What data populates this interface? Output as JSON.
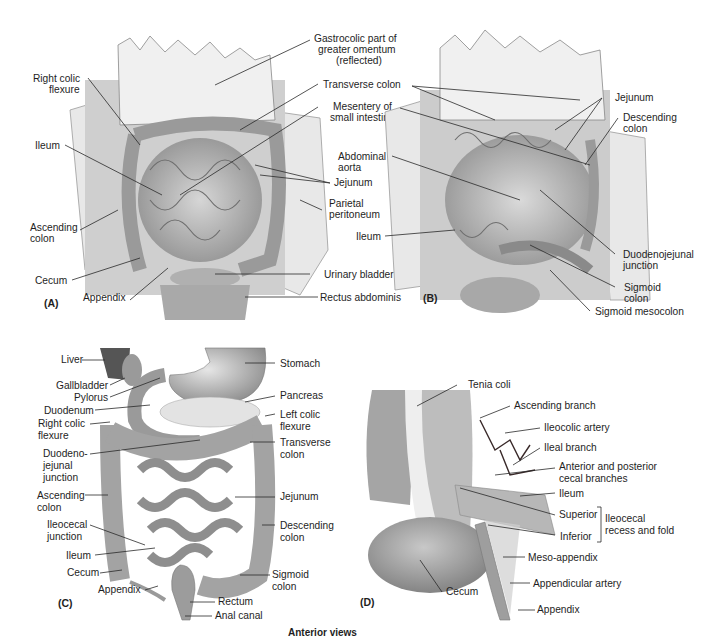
{
  "figure": {
    "caption": "Anterior views",
    "panels": {
      "A": {
        "tag": "(A)",
        "labels": {
          "gastrocolic": [
            "Gastrocolic part of",
            "greater omentum",
            "(reflected)"
          ],
          "right_colic_flexure": [
            "Right colic",
            "flexure"
          ],
          "transverse_colon": "Transverse colon",
          "mesentery": [
            "Mesentery of",
            "small intestine"
          ],
          "ileum": "Ileum",
          "jejunum": "Jejunum",
          "parietal_peritoneum": [
            "Parietal",
            "peritoneum"
          ],
          "ascending_colon": [
            "Ascending",
            "colon"
          ],
          "cecum": "Cecum",
          "urinary_bladder": "Urinary bladder",
          "appendix": "Appendix",
          "rectus_abdominis": "Rectus abdominis"
        }
      },
      "B": {
        "tag": "(B)",
        "labels": {
          "jejunum": "Jejunum",
          "descending_colon": [
            "Descending",
            "colon"
          ],
          "abdominal_aorta": [
            "Abdominal",
            "aorta"
          ],
          "ileum": "Ileum",
          "duodenojejunal_junction": [
            "Duodenojejunal",
            "junction"
          ],
          "sigmoid_colon": [
            "Sigmoid",
            "colon"
          ],
          "sigmoid_mesocolon": "Sigmoid mesocolon"
        }
      },
      "C": {
        "tag": "(C)",
        "labels": {
          "liver": "Liver",
          "gallbladder": "Gallbladder",
          "pylorus": "Pylorus",
          "duodenum": "Duodenum",
          "right_colic_flexure": [
            "Right colic",
            "flexure"
          ],
          "duodenojejunal_junction": [
            "Duodeno-",
            "jejunal",
            "junction"
          ],
          "ascending_colon": [
            "Ascending",
            "colon"
          ],
          "ileocecal_junction": [
            "Ileocecal",
            "junction"
          ],
          "ileum": "Ileum",
          "cecum": "Cecum",
          "appendix": "Appendix",
          "stomach": "Stomach",
          "pancreas": "Pancreas",
          "left_colic_flexure": [
            "Left colic",
            "flexure"
          ],
          "transverse_colon": [
            "Transverse",
            "colon"
          ],
          "jejunum": "Jejunum",
          "descending_colon": [
            "Descending",
            "colon"
          ],
          "sigmoid_colon": [
            "Sigmoid",
            "colon"
          ],
          "rectum": "Rectum",
          "anal_canal": "Anal canal"
        }
      },
      "D": {
        "tag": "(D)",
        "labels": {
          "tenia_coli": "Tenia coli",
          "ascending_branch": "Ascending branch",
          "ileocolic_artery": "Ileocolic artery",
          "ileal_branch": "Ileal branch",
          "cecal_branches": [
            "Anterior and posterior",
            "cecal branches"
          ],
          "ileum": "Ileum",
          "superior": "Superior",
          "inferior": "Inferior",
          "ileocecal_recess": [
            "Ileocecal",
            "recess and fold"
          ],
          "meso_appendix": "Meso-appendix",
          "appendicular_artery": "Appendicular artery",
          "appendix": "Appendix",
          "cecum": "Cecum"
        }
      }
    },
    "colors": {
      "tissue_light": "#e4e4e4",
      "tissue_mid": "#b8b8b8",
      "tissue_dark": "#8c8c8c",
      "vessel": "#3a2a2a",
      "text": "#1e1e1e"
    }
  }
}
